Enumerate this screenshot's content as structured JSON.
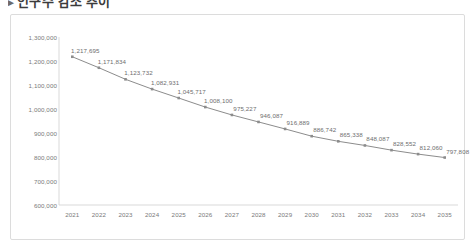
{
  "page": {
    "title": "인구수 감소 추이",
    "bullet": "▸"
  },
  "chart_data": {
    "type": "line",
    "title": "",
    "xlabel": "",
    "ylabel": "",
    "categories": [
      "2021",
      "2022",
      "2023",
      "2024",
      "2025",
      "2026",
      "2027",
      "2028",
      "2029",
      "2030",
      "2031",
      "2032",
      "2033",
      "2034",
      "2035"
    ],
    "values": [
      1217695,
      1171834,
      1123732,
      1082931,
      1045717,
      1008100,
      975227,
      946087,
      916889,
      886742,
      865338,
      848087,
      828552,
      812060,
      797808
    ],
    "value_labels": [
      "1,217,695",
      "1,171,834",
      "1,123,732",
      "1,082,931",
      "1,045,717",
      "1,008,100",
      "975,227",
      "946,087",
      "916,889",
      "886,742",
      "865,338",
      "848,087",
      "828,552",
      "812,060",
      "797,808"
    ],
    "ylim": [
      600000,
      1300000
    ],
    "ytick_values": [
      1300000,
      1200000,
      1100000,
      1000000,
      900000,
      800000,
      700000,
      600000
    ],
    "ytick_labels": [
      "1,300,000",
      "1,200,000",
      "1,100,000",
      "1,000,000",
      "900,000",
      "800,000",
      "700,000",
      "600,000"
    ],
    "grid": false,
    "legend": null,
    "series_color": "#8c8c8c",
    "marker": "square",
    "marker_color": "#8c8c8c",
    "label_color": "#6e6e6e",
    "axis_color": "#d9d9d9",
    "tick_label_color": "#7a7a7a"
  }
}
